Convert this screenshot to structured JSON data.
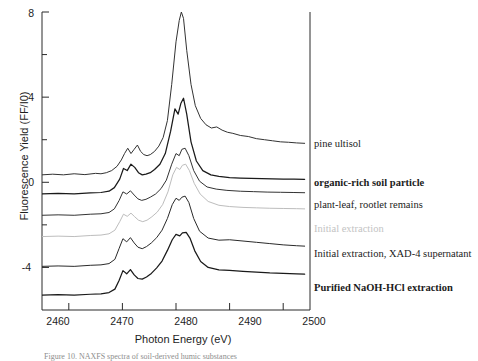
{
  "figure": {
    "domain": "chart",
    "caption_partial": "Figure 10.  NAXFS spectra of soil-derived humic substances"
  },
  "chart_data": {
    "type": "line",
    "title": "",
    "xlabel": "Photon Energy  (eV)",
    "ylabel": "Fluorescence Yield (FF/I0)",
    "xlim": [
      2455,
      2505
    ],
    "ylim": [
      -6,
      8
    ],
    "xticks": [
      2460,
      2470,
      2480,
      2490,
      2500
    ],
    "yticks": [
      8,
      4,
      0,
      -4
    ],
    "yticks_minor": [
      6,
      2,
      -2
    ],
    "grid": false,
    "legend_position": "right-inline",
    "offset_note": "Spectra are vertically offset (stacked); labels appear to the right of the plot frame.",
    "series": [
      {
        "name": "pine ultisol",
        "label_style": "regular",
        "color": "#333333",
        "baseline": 0.35,
        "peak_energy": 2481.0,
        "peak_value": 8.0,
        "x": [
          2455,
          2457,
          2459,
          2461,
          2463,
          2465,
          2466,
          2467,
          2468,
          2469,
          2469.8,
          2470.4,
          2471,
          2471.6,
          2472.2,
          2472.8,
          2473.4,
          2474,
          2474.6,
          2475.2,
          2476,
          2476.8,
          2477.6,
          2478.4,
          2479.2,
          2480,
          2480.6,
          2481,
          2481.4,
          2482,
          2482.8,
          2483.6,
          2484.6,
          2485.6,
          2486.6,
          2487.6,
          2488.6,
          2489.6,
          2490.6,
          2492,
          2493.5,
          2495,
          2496.5,
          2498,
          2499.5,
          2501,
          2502.5,
          2504
        ],
        "y": [
          0.35,
          0.38,
          0.35,
          0.4,
          0.36,
          0.42,
          0.4,
          0.45,
          0.55,
          0.75,
          1.05,
          1.35,
          1.6,
          1.35,
          1.55,
          1.75,
          1.45,
          1.3,
          1.25,
          1.3,
          1.45,
          1.7,
          2.1,
          2.9,
          4.6,
          6.6,
          7.6,
          8.0,
          7.7,
          6.2,
          4.6,
          3.6,
          3.0,
          2.7,
          2.55,
          2.6,
          2.45,
          2.35,
          2.3,
          2.2,
          2.15,
          2.05,
          2.0,
          1.95,
          1.9,
          1.88,
          1.85,
          1.83
        ]
      },
      {
        "name": "organic-rich soil particle",
        "label_style": "bold",
        "color": "#1a1a1a",
        "baseline": -0.55,
        "peak_energy": 2481.0,
        "peak_value": 4.0,
        "x": [
          2455,
          2458,
          2461,
          2464,
          2466,
          2467.5,
          2468.5,
          2469.5,
          2470.2,
          2470.9,
          2471.6,
          2472.3,
          2473,
          2473.7,
          2474.4,
          2475.2,
          2476,
          2477,
          2478,
          2479,
          2479.8,
          2480.4,
          2480.9,
          2481.4,
          2482,
          2482.8,
          2483.8,
          2485,
          2486.5,
          2488,
          2490,
          2492,
          2494,
          2496,
          2498,
          2500,
          2502,
          2504
        ],
        "y": [
          -0.55,
          -0.52,
          -0.55,
          -0.5,
          -0.48,
          -0.42,
          -0.25,
          0.15,
          0.65,
          0.55,
          0.85,
          0.7,
          0.45,
          0.35,
          0.38,
          0.45,
          0.6,
          0.85,
          1.35,
          2.4,
          3.45,
          3.2,
          3.7,
          3.95,
          3.2,
          1.9,
          1.0,
          0.55,
          0.35,
          0.28,
          0.22,
          0.2,
          0.18,
          0.17,
          0.16,
          0.15,
          0.15,
          0.14
        ]
      },
      {
        "name": "plant-leaf, rootlet remains",
        "label_style": "regular",
        "color": "#333333",
        "baseline": -1.55,
        "peak_energy": 2481.0,
        "peak_value": 1.6,
        "x": [
          2455,
          2458,
          2461,
          2464,
          2466,
          2467.5,
          2468.5,
          2469.4,
          2470.1,
          2470.8,
          2471.5,
          2472.2,
          2472.9,
          2473.6,
          2474.4,
          2475.2,
          2476.2,
          2477.2,
          2478.2,
          2479.2,
          2480,
          2480.6,
          2481.1,
          2481.7,
          2482.4,
          2483.3,
          2484.4,
          2485.8,
          2487.5,
          2489.5,
          2492,
          2494.5,
          2497,
          2499.5,
          2502,
          2504
        ],
        "y": [
          -1.55,
          -1.53,
          -1.55,
          -1.5,
          -1.48,
          -1.42,
          -1.25,
          -0.85,
          -0.45,
          -0.55,
          -0.4,
          -0.6,
          -0.78,
          -0.85,
          -0.8,
          -0.7,
          -0.55,
          -0.3,
          0.1,
          0.85,
          1.35,
          1.25,
          1.55,
          1.6,
          1.25,
          0.55,
          0.05,
          -0.22,
          -0.32,
          -0.38,
          -0.42,
          -0.44,
          -0.46,
          -0.47,
          -0.48,
          -0.49
        ]
      },
      {
        "name": "Initial extraction",
        "label_style": "faint",
        "color": "#bdbdbd",
        "baseline": -2.55,
        "peak_energy": 2481.0,
        "peak_value": 0.85,
        "x": [
          2455,
          2458,
          2461,
          2464,
          2466,
          2467.5,
          2468.6,
          2469.5,
          2470.2,
          2470.9,
          2471.6,
          2472.3,
          2473,
          2473.8,
          2474.6,
          2475.5,
          2476.5,
          2477.5,
          2478.5,
          2479.4,
          2480.1,
          2480.7,
          2481.2,
          2481.8,
          2482.5,
          2483.4,
          2484.5,
          2486,
          2488,
          2490,
          2492.5,
          2495,
          2497.5,
          2500,
          2502.5,
          2504
        ],
        "y": [
          -2.55,
          -2.53,
          -2.55,
          -2.5,
          -2.48,
          -2.42,
          -2.25,
          -1.85,
          -1.5,
          -1.6,
          -1.45,
          -1.62,
          -1.78,
          -1.85,
          -1.78,
          -1.62,
          -1.4,
          -1.05,
          -0.45,
          0.35,
          0.7,
          0.6,
          0.8,
          0.85,
          0.55,
          -0.05,
          -0.55,
          -0.9,
          -1.08,
          -1.14,
          -1.18,
          -1.2,
          -1.22,
          -1.23,
          -1.24,
          -1.25
        ]
      },
      {
        "name": "Initial extraction, XAD-4 supernatant",
        "label_style": "regular",
        "color": "#2a2a2a",
        "baseline": -3.95,
        "peak_energy": 2481.0,
        "peak_value": -0.65,
        "x": [
          2455,
          2458,
          2461,
          2464,
          2466,
          2467.5,
          2468.6,
          2469.4,
          2470.1,
          2470.8,
          2471.5,
          2472.2,
          2472.9,
          2473.7,
          2474.5,
          2475.4,
          2476.4,
          2477.4,
          2478.4,
          2479.3,
          2480,
          2480.6,
          2481.1,
          2481.7,
          2482.4,
          2483.3,
          2484.4,
          2486,
          2488,
          2490,
          2492.5,
          2495,
          2497.5,
          2500,
          2502.5,
          2504
        ],
        "y": [
          -3.95,
          -3.93,
          -3.95,
          -3.9,
          -3.88,
          -3.82,
          -3.62,
          -3.1,
          -2.65,
          -2.8,
          -2.6,
          -2.85,
          -3.05,
          -3.12,
          -3.02,
          -2.85,
          -2.6,
          -2.25,
          -1.7,
          -1.05,
          -0.75,
          -0.85,
          -0.7,
          -0.65,
          -0.95,
          -1.7,
          -2.3,
          -2.62,
          -2.72,
          -2.7,
          -2.76,
          -2.82,
          -2.88,
          -2.94,
          -2.98,
          -3.0
        ]
      },
      {
        "name": "Purified NaOH-HCl extraction",
        "label_style": "bold",
        "color": "#1a1a1a",
        "baseline": -5.3,
        "peak_energy": 2481.0,
        "peak_value": -2.35,
        "x": [
          2455,
          2458,
          2461,
          2464,
          2466,
          2467.5,
          2468.6,
          2469.4,
          2470.1,
          2470.8,
          2471.5,
          2472.2,
          2472.9,
          2473.7,
          2474.5,
          2475.4,
          2476.4,
          2477.4,
          2478.4,
          2479.3,
          2480,
          2480.7,
          2481.2,
          2481.9,
          2482.6,
          2483.5,
          2484.6,
          2486,
          2488,
          2490,
          2492.5,
          2495,
          2497.5,
          2500,
          2502.5,
          2504
        ],
        "y": [
          -5.3,
          -5.28,
          -5.3,
          -5.26,
          -5.24,
          -5.18,
          -5.02,
          -4.6,
          -4.15,
          -4.3,
          -4.1,
          -4.35,
          -4.52,
          -4.55,
          -4.45,
          -4.28,
          -4.02,
          -3.7,
          -3.2,
          -2.7,
          -2.45,
          -2.52,
          -2.38,
          -2.35,
          -2.62,
          -3.22,
          -3.72,
          -4.0,
          -4.12,
          -4.14,
          -4.18,
          -4.22,
          -4.26,
          -4.28,
          -4.3,
          -4.32
        ]
      }
    ]
  },
  "axis": {
    "xticklabels": [
      "2460",
      "2470",
      "2480",
      "2490",
      "2500"
    ],
    "yticklabels": [
      "8",
      "4",
      "0",
      "-4"
    ]
  }
}
